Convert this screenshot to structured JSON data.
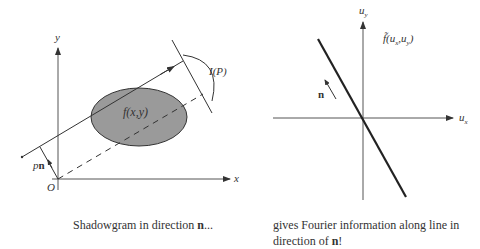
{
  "left_diagram": {
    "axis_x_label": "x",
    "axis_y_label": "y",
    "origin_label": "O",
    "object_label": "f(x,y)",
    "projection_label": "I(P)",
    "offset_label_p": "p",
    "offset_label_n": "n",
    "caption_text": "Shadowgram in direction ",
    "caption_bold": "n",
    "caption_suffix": "..."
  },
  "right_diagram": {
    "axis_x_label": "u",
    "axis_x_sub": "x",
    "axis_y_label": "u",
    "axis_y_sub": "y",
    "transform_label_f": "f̃(u",
    "transform_sub_x": "x",
    "transform_mid": ",u",
    "transform_sub_y": "y",
    "transform_close": ")",
    "direction_label": "n",
    "caption_line1": "gives Fourier information along line in",
    "caption_line2_text": "direction of ",
    "caption_line2_bold": "n",
    "caption_line2_suffix": "!"
  },
  "colors": {
    "ellipse_fill": "#9a9a9a",
    "line": "#333333",
    "axis": "#555555"
  }
}
